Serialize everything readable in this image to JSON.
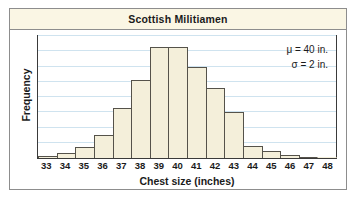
{
  "figure": {
    "title": "Scottish Militiamen"
  },
  "annotations": {
    "mean": "μ = 40 in.",
    "sd": "σ = 2 in."
  },
  "chart_data": {
    "type": "bar",
    "title": "Scottish Militiamen",
    "xlabel": "Chest size (inches)",
    "ylabel": "Frequency",
    "categories": [
      "33",
      "34",
      "35",
      "36",
      "37",
      "38",
      "39",
      "40",
      "41",
      "42",
      "43",
      "44",
      "45",
      "46",
      "47",
      "48"
    ],
    "values": [
      0.1,
      0.35,
      0.7,
      1.5,
      3.3,
      5.1,
      7.3,
      7.3,
      6.0,
      4.6,
      3.0,
      0.8,
      0.45,
      0.2,
      0.05,
      0.0
    ],
    "ylim": [
      0,
      8
    ],
    "y_gridlines": [
      1,
      2,
      3,
      4,
      5,
      6,
      7,
      8
    ],
    "grid": true,
    "legend": "none",
    "annotations": [
      "μ = 40 in.",
      "σ = 2 in."
    ],
    "bar_fill": "#f4efda",
    "bar_edge": "#55524a",
    "gridline_color": "#cfe3ef",
    "title_band_color": "#faf6e4"
  }
}
